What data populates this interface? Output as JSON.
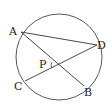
{
  "diagram": {
    "type": "circle-geometry",
    "circle": {
      "cx": 59,
      "cy": 57,
      "r": 43
    },
    "points": {
      "A": {
        "label": "A",
        "x": 21,
        "y": 32
      },
      "B": {
        "label": "B",
        "x": 84,
        "y": 86
      },
      "C": {
        "label": "C",
        "x": 25,
        "y": 81
      },
      "D": {
        "label": "D",
        "x": 97,
        "y": 45
      },
      "P": {
        "label": "P",
        "x": 58,
        "y": 65
      }
    },
    "segments": [
      {
        "from": "A",
        "to": "B"
      },
      {
        "from": "C",
        "to": "D"
      },
      {
        "from": "A",
        "to": "D"
      }
    ],
    "angle_marker": {
      "at": "P",
      "note": "angle arc at intersection P"
    },
    "stroke_color": "#333333"
  }
}
